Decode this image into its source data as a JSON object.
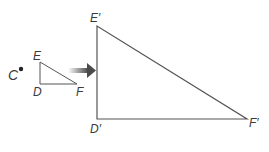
{
  "diagram": {
    "center_point": {
      "label": "C",
      "x": 21,
      "y": 69
    },
    "original_triangle": {
      "vertices": [
        {
          "label": "E",
          "x": 40,
          "y": 62
        },
        {
          "label": "D",
          "x": 40,
          "y": 84
        },
        {
          "label": "F",
          "x": 77,
          "y": 84
        }
      ]
    },
    "image_triangle": {
      "vertices": [
        {
          "label": "E′",
          "x": 97,
          "y": 26
        },
        {
          "label": "D′",
          "x": 97,
          "y": 119
        },
        {
          "label": "F′",
          "x": 247,
          "y": 119
        }
      ]
    },
    "arrow": {
      "from_x": 68,
      "to_x": 96,
      "y": 71,
      "meaning": "dilation"
    },
    "colors": {
      "line": "#555555",
      "arrow": "#4a4a4a",
      "text": "#3a3a3a"
    }
  }
}
